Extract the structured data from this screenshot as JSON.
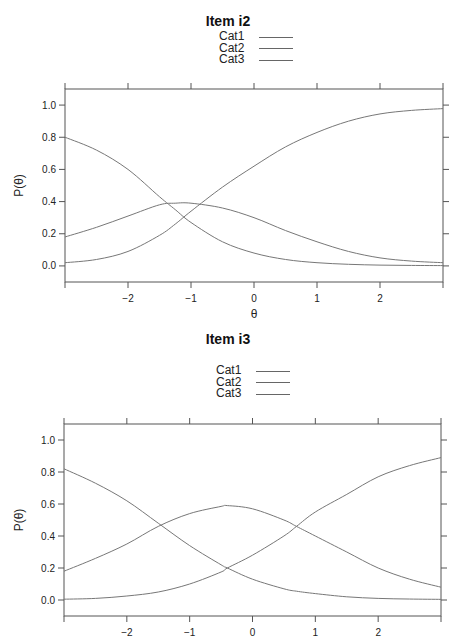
{
  "chart_data": [
    {
      "type": "line",
      "title": "Item i2",
      "xlabel": "θ",
      "ylabel": "P(θ)",
      "xlim": [
        -3,
        3
      ],
      "ylim": [
        -0.1,
        1.1
      ],
      "grid": false,
      "legend_position": "top-center",
      "x_ticks": [
        "−2",
        "−1",
        "0",
        "1",
        "2"
      ],
      "x_tick_values": [
        -2,
        -1,
        0,
        1,
        2
      ],
      "y_ticks": [
        "0.0",
        "0.2",
        "0.4",
        "0.6",
        "0.8",
        "1.0"
      ],
      "y_tick_values": [
        0,
        0.2,
        0.4,
        0.6,
        0.8,
        1.0
      ],
      "x": [
        -3,
        -2.5,
        -2,
        -1.5,
        -1.25,
        -1,
        -0.5,
        0,
        0.5,
        1,
        1.5,
        2,
        2.5,
        3
      ],
      "series": [
        {
          "name": "Cat1",
          "values": [
            0.8,
            0.72,
            0.6,
            0.43,
            0.35,
            0.27,
            0.15,
            0.08,
            0.04,
            0.02,
            0.01,
            0.005,
            0.003,
            0.002
          ]
        },
        {
          "name": "Cat2",
          "values": [
            0.18,
            0.24,
            0.31,
            0.38,
            0.39,
            0.39,
            0.36,
            0.3,
            0.22,
            0.15,
            0.09,
            0.05,
            0.03,
            0.02
          ]
        },
        {
          "name": "Cat3",
          "values": [
            0.02,
            0.04,
            0.09,
            0.19,
            0.26,
            0.34,
            0.49,
            0.62,
            0.74,
            0.83,
            0.9,
            0.945,
            0.967,
            0.978
          ]
        }
      ],
      "x_label_visible": true
    },
    {
      "type": "line",
      "title": "Item i3",
      "xlabel": "",
      "ylabel": "P(θ)",
      "xlim": [
        -3,
        3
      ],
      "ylim": [
        -0.1,
        1.1
      ],
      "grid": false,
      "legend_position": "top-center",
      "x_ticks": [
        "−2",
        "−1",
        "0",
        "1",
        "2"
      ],
      "x_tick_values": [
        -2,
        -1,
        0,
        1,
        2
      ],
      "y_ticks": [
        "0.0",
        "0.2",
        "0.4",
        "0.6",
        "0.8",
        "1.0"
      ],
      "y_tick_values": [
        0,
        0.2,
        0.4,
        0.6,
        0.8,
        1.0
      ],
      "x": [
        -3,
        -2.5,
        -2,
        -1.5,
        -1,
        -0.5,
        -0.4,
        0,
        0.5,
        0.7,
        1,
        1.5,
        2,
        2.5,
        3
      ],
      "series": [
        {
          "name": "Cat1",
          "values": [
            0.82,
            0.73,
            0.62,
            0.48,
            0.34,
            0.22,
            0.2,
            0.13,
            0.07,
            0.055,
            0.04,
            0.02,
            0.01,
            0.006,
            0.004
          ]
        },
        {
          "name": "Cat2",
          "values": [
            0.18,
            0.26,
            0.35,
            0.46,
            0.54,
            0.585,
            0.59,
            0.57,
            0.5,
            0.46,
            0.4,
            0.3,
            0.2,
            0.13,
            0.08
          ]
        },
        {
          "name": "Cat3",
          "values": [
            0.005,
            0.01,
            0.025,
            0.05,
            0.1,
            0.175,
            0.2,
            0.28,
            0.4,
            0.46,
            0.55,
            0.66,
            0.77,
            0.84,
            0.89
          ]
        }
      ],
      "x_label_visible": false
    }
  ],
  "panels": [
    {
      "title": "Item i2",
      "legend": [
        "Cat1",
        "Cat2",
        "Cat3"
      ],
      "ylabel": "P(θ)",
      "xlabel": "θ"
    },
    {
      "title": "Item i3",
      "legend": [
        "Cat1",
        "Cat2",
        "Cat3"
      ],
      "ylabel": "P(θ)",
      "xlabel": ""
    }
  ]
}
